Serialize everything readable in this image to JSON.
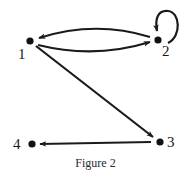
{
  "figure": {
    "caption": "Figure 2",
    "type": "directed-graph",
    "colors": {
      "ink": "#1a1a1a",
      "background": "#ffffff"
    },
    "nodes": [
      {
        "id": "1",
        "label": "1"
      },
      {
        "id": "2",
        "label": "2"
      },
      {
        "id": "3",
        "label": "3"
      },
      {
        "id": "4",
        "label": "4"
      }
    ],
    "edges": [
      {
        "from": "2",
        "to": "1",
        "shape": "curved-arc-top"
      },
      {
        "from": "1",
        "to": "2",
        "shape": "curved-arc-bottom"
      },
      {
        "from": "2",
        "to": "2",
        "shape": "self-loop"
      },
      {
        "from": "1",
        "to": "3",
        "shape": "straight"
      },
      {
        "from": "3",
        "to": "4",
        "shape": "straight"
      }
    ]
  }
}
